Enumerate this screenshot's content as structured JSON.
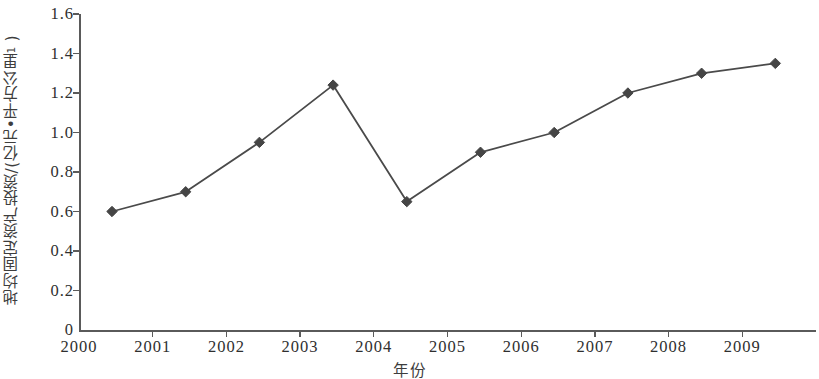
{
  "chart_data": {
    "type": "line",
    "title": "",
    "xlabel": "年份",
    "ylabel": "地均固定资产投资/(亿元•平方公里",
    "ylabel_superscript": "-1",
    "ylabel_suffix": ")",
    "categories": [
      "2000",
      "2001",
      "2002",
      "2003",
      "2004",
      "2005",
      "2006",
      "2007",
      "2008",
      "2009"
    ],
    "x": [
      2000,
      2001,
      2002,
      2003,
      2004,
      2005,
      2006,
      2007,
      2008,
      2009
    ],
    "values": [
      0.6,
      0.7,
      0.95,
      1.24,
      0.65,
      0.9,
      1.0,
      1.2,
      1.3,
      1.35
    ],
    "series": [
      {
        "name": "地均固定资产投资",
        "values": [
          0.6,
          0.7,
          0.95,
          1.24,
          0.65,
          0.9,
          1.0,
          1.2,
          1.3,
          1.35
        ]
      }
    ],
    "ylim": [
      0,
      1.6
    ],
    "yticks": [
      "0",
      "0.2",
      "0.4",
      "0.6",
      "0.8",
      "1.0",
      "1.2",
      "1.4",
      "1.6"
    ],
    "ytick_values": [
      0,
      0.2,
      0.4,
      0.6,
      0.8,
      1.0,
      1.2,
      1.4,
      1.6
    ],
    "xticks": [
      "2000",
      "2001",
      "2002",
      "2003",
      "2004",
      "2005",
      "2006",
      "2007",
      "2008",
      "2009"
    ],
    "grid": false,
    "legend": null,
    "marker": "diamond",
    "line_color": "#4a4a4a",
    "marker_color": "#454545",
    "axis_color": "#5a5a5a",
    "background_color": "#ffffff"
  }
}
